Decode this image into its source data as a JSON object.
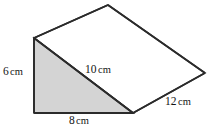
{
  "figure": {
    "name": "triangular-prism-wedge",
    "background_color": "#ffffff",
    "stroke_color": "#2b2b2b",
    "shaded_face_color": "#d4d4d4",
    "top_face_color": "#ffffff",
    "stroke_width": 1.6,
    "labels": {
      "height": {
        "value": "6",
        "unit": "cm"
      },
      "base": {
        "value": "8",
        "unit": "cm"
      },
      "slant": {
        "value": "10",
        "unit": "cm"
      },
      "depth": {
        "value": "12",
        "unit": "cm"
      }
    },
    "geometry": {
      "triangle_top": [
        34,
        38
      ],
      "triangle_bottom_left": [
        34,
        113
      ],
      "triangle_bottom_right": [
        133,
        113
      ],
      "apex_back": [
        108,
        5
      ],
      "vertex_right": [
        205,
        73
      ]
    }
  }
}
